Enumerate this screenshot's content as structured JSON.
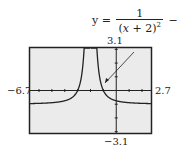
{
  "equation": {
    "lhs": "y =",
    "numerator": "1",
    "denominator_open": "(",
    "denominator_var": "x",
    "denominator_rest": " + 2)",
    "exponent": "2",
    "tail": "− 1"
  },
  "window": {
    "xmin_label": "−6.7",
    "xmax_label": "2.7",
    "ymax_label": "3.1",
    "ymin_label": "−3.1"
  },
  "colors": {
    "screen_bg": "#ebebeb",
    "frame": "#222222",
    "curve": "#222222"
  },
  "chart_data": {
    "type": "line",
    "function": "1/(x+2)^2 - 1",
    "xlim": [
      -6.7,
      2.7
    ],
    "ylim": [
      -3.1,
      3.1
    ],
    "vertical_asymptote": -2,
    "horizontal_asymptote": -1,
    "x_tick_spacing": 1,
    "y_tick_spacing": 1,
    "grid": false,
    "annotation": "arrow from equation to right branch of curve"
  }
}
